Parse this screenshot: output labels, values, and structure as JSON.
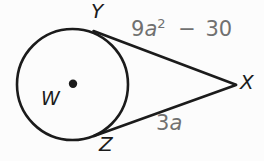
{
  "figure": {
    "type": "geometry-diagram",
    "colors": {
      "background": "#fcfcfc",
      "stroke": "#1b1b1b",
      "text": "#1b1b1b",
      "expression": "#707070"
    },
    "points": {
      "center": "W",
      "tangent_top": "Y",
      "tangent_bottom": "Z",
      "external": "X"
    },
    "segments": {
      "yx": {
        "coefficient": "9",
        "variable": "a",
        "exponent": "2",
        "tail": " − 30",
        "expression": "9a² − 30"
      },
      "zx": {
        "coefficient": "3",
        "variable": "a",
        "expression": "3a"
      }
    }
  }
}
